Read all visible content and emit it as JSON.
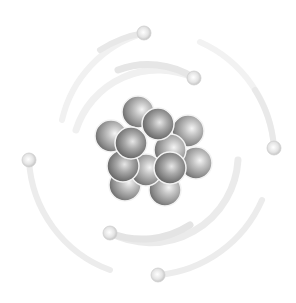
{
  "illustration": {
    "subject": "atom",
    "background": "#ffffff",
    "orbit_color": "#ececec",
    "nucleus": {
      "particles": [
        {
          "cx": 138,
          "cy": 112,
          "layer": "back"
        },
        {
          "cx": 188,
          "cy": 131,
          "layer": "back"
        },
        {
          "cx": 111,
          "cy": 136,
          "layer": "back"
        },
        {
          "cx": 196,
          "cy": 163,
          "layer": "back"
        },
        {
          "cx": 125,
          "cy": 185,
          "layer": "back"
        },
        {
          "cx": 165,
          "cy": 190,
          "layer": "back"
        },
        {
          "cx": 170,
          "cy": 150,
          "layer": "back"
        },
        {
          "cx": 146,
          "cy": 170,
          "layer": "back"
        },
        {
          "cx": 158,
          "cy": 124,
          "layer": "front"
        },
        {
          "cx": 123,
          "cy": 166,
          "layer": "mid"
        },
        {
          "cx": 131,
          "cy": 143,
          "layer": "front"
        },
        {
          "cx": 170,
          "cy": 168,
          "layer": "front"
        }
      ],
      "radius": 16
    },
    "electrons": [
      {
        "cx": 144,
        "cy": 33
      },
      {
        "cx": 194,
        "cy": 78
      },
      {
        "cx": 274,
        "cy": 148
      },
      {
        "cx": 29,
        "cy": 160
      },
      {
        "cx": 110,
        "cy": 233
      },
      {
        "cx": 158,
        "cy": 275
      }
    ]
  }
}
